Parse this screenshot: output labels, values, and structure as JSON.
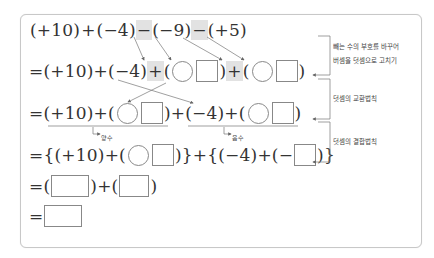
{
  "worksheet": {
    "rows": [
      {
        "id": "row1",
        "tokens": [
          "(+10)",
          "+",
          "(−4)",
          "−",
          "(−9)",
          "−",
          "(+5)"
        ]
      },
      {
        "id": "row2",
        "lead": "=",
        "tokens": [
          "(+10)",
          "+",
          "(−4)",
          "+",
          "(",
          ")",
          "+",
          "(",
          ")"
        ]
      },
      {
        "id": "row3",
        "lead": "=",
        "tokens": [
          "(+10)",
          "+",
          "(",
          ")",
          "+",
          "(−4)",
          "+",
          "(",
          ")"
        ]
      },
      {
        "id": "row4",
        "lead": "=",
        "tokens": [
          "{(+10)",
          "+",
          "(",
          ")}",
          "+",
          "{(−4)",
          "+",
          "(−",
          ")}"
        ]
      },
      {
        "id": "row5",
        "lead": "=",
        "tokens": [
          "(",
          ")",
          "+",
          "(",
          ")"
        ]
      },
      {
        "id": "row6",
        "lead": "="
      }
    ],
    "row1": {
      "p1": "(+10)",
      "plus": "+",
      "p2": "(−4)",
      "minus1": "−",
      "p3": "(−9)",
      "minus2": "−",
      "p4": "(+5)"
    },
    "row2": {
      "eq": "=",
      "p1": "(+10)",
      "plus1": "+",
      "p2": "(−4)",
      "plus2": "+",
      "open1": "(",
      "close1": ")",
      "plus3": "+",
      "open2": "(",
      "close2": ")"
    },
    "row3": {
      "eq": "=",
      "p1": "(+10)",
      "plus1": "+",
      "open1": "(",
      "close1": ")",
      "plus2": "+",
      "p2": "(−4)",
      "plus3": "+",
      "open2": "(",
      "close2": ")"
    },
    "row4": {
      "eq": "=",
      "p1": "{(+10)",
      "plus1": "+",
      "open1": "(",
      "close1": ")}",
      "plus2": "+",
      "p2": "{(−4)",
      "plus3": "+",
      "open2": "(−",
      "close2": ")}"
    },
    "row5": {
      "eq": "=",
      "open1": "(",
      "close1": ")",
      "plus": "+",
      "open2": "(",
      "close2": ")"
    },
    "row6": {
      "eq": "="
    },
    "labels": {
      "positive": "양수",
      "negative": "음수"
    },
    "annotations": {
      "step1_line1": "빼는 수의 부호를 바꾸어",
      "step1_line2": "버셈을 덧셈으로 고치기",
      "step2": "덧셈의 교환법칙",
      "step3": "덧셈의 결합법칙"
    },
    "colors": {
      "highlight": "#e2e2e2",
      "border": "#c8c8c8",
      "text": "#333333"
    }
  }
}
